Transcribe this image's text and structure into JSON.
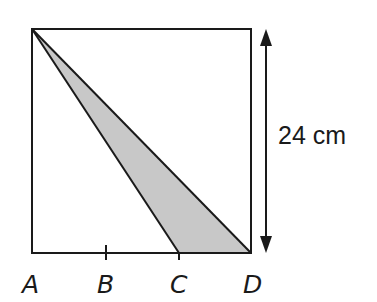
{
  "diagram": {
    "type": "geometry",
    "square": {
      "side_label": "24 cm",
      "x0": 32,
      "y0": 29,
      "x1": 251,
      "y1": 253
    },
    "points": [
      {
        "name": "A",
        "x": 32,
        "y": 253,
        "label_x": 22,
        "label_y": 293
      },
      {
        "name": "B",
        "x": 106,
        "y": 253,
        "label_x": 97,
        "label_y": 293
      },
      {
        "name": "C",
        "x": 179,
        "y": 253,
        "label_x": 170,
        "label_y": 293
      },
      {
        "name": "D",
        "x": 251,
        "y": 253,
        "label_x": 243,
        "label_y": 293
      }
    ],
    "shaded_triangle": {
      "vertices": [
        "top-left",
        "C",
        "D"
      ],
      "fill": "#c8c8c8"
    },
    "dimension": {
      "label": "24 cm",
      "x": 266,
      "y_top": 29,
      "y_bottom": 253
    },
    "colors": {
      "stroke": "#1a1a1a",
      "fill": "#c8c8c8",
      "background": "#ffffff"
    }
  }
}
